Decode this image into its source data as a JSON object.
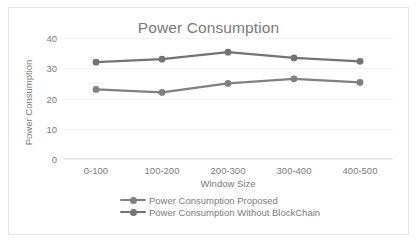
{
  "chart_data": {
    "type": "line",
    "title": "Power Consumption",
    "xlabel": "Window Size",
    "ylabel": "Power Consumption",
    "categories": [
      "0-100",
      "100-200",
      "200-300",
      "300-400",
      "400-500"
    ],
    "yticks": [
      0,
      10,
      20,
      30,
      40
    ],
    "ylim": [
      0,
      40
    ],
    "grid": true,
    "legend_position": "bottom",
    "series": [
      {
        "name": "Power Consumption Proposed",
        "color": "#808080",
        "values": [
          23.0,
          22.0,
          25.0,
          26.5,
          25.3
        ]
      },
      {
        "name": "Power Consumption Without BlockChain",
        "color": "#737373",
        "values": [
          32.0,
          33.0,
          35.3,
          33.4,
          32.3
        ]
      }
    ]
  },
  "style": {
    "title_color": "#7a7a7a",
    "tick_color": "#7c7c7c",
    "grid_color": "#f2f2f2",
    "border_color": "#e6e6e6",
    "background": "#ffffff"
  }
}
